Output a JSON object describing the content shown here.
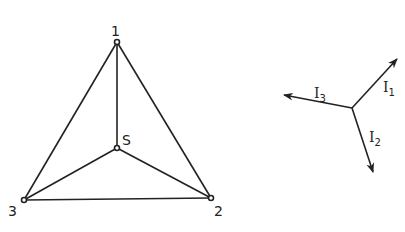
{
  "network": {
    "nodes": [
      {
        "id": "1",
        "label": "1"
      },
      {
        "id": "2",
        "label": "2"
      },
      {
        "id": "3",
        "label": "3"
      },
      {
        "id": "S",
        "label": "S"
      }
    ],
    "edges": [
      [
        "1",
        "2"
      ],
      [
        "2",
        "3"
      ],
      [
        "3",
        "1"
      ],
      [
        "S",
        "1"
      ],
      [
        "S",
        "2"
      ],
      [
        "S",
        "3"
      ]
    ]
  },
  "phasors": {
    "items": [
      {
        "name": "I",
        "sub": "1"
      },
      {
        "name": "I",
        "sub": "2"
      },
      {
        "name": "I",
        "sub": "3"
      }
    ]
  }
}
